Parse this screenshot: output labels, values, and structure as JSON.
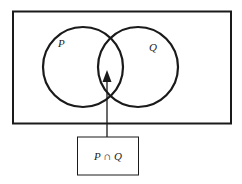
{
  "diagram": {
    "type": "venn",
    "sets": [
      {
        "label": "P"
      },
      {
        "label": "Q"
      }
    ],
    "highlighted_region": "intersection",
    "callout_label": "P ∩ Q",
    "colors": {
      "stroke": "#1a1a1a",
      "background": "#ffffff"
    }
  }
}
